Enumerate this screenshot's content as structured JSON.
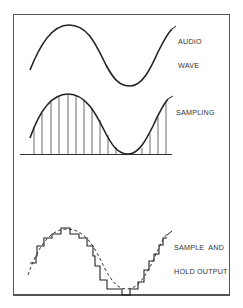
{
  "diagram": {
    "panels": [
      {
        "id": "audio-wave",
        "label_lines": [
          "AUDIO",
          "WAVE"
        ]
      },
      {
        "id": "sampling",
        "label_lines": [
          "SAMPLING"
        ]
      },
      {
        "id": "sample-and-hold",
        "label_lines": [
          "SAMPLE  AND",
          "HOLD OUTPUT"
        ]
      }
    ],
    "colors": {
      "stroke": "#222222",
      "frame": "#555555",
      "background": "#ffffff"
    }
  }
}
